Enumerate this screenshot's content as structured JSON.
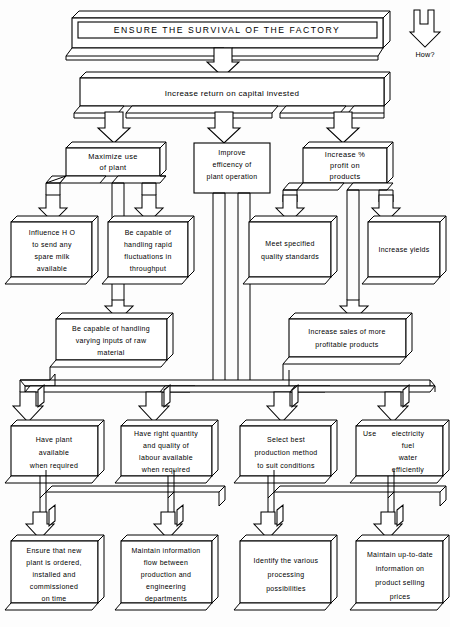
{
  "title": "ENSURE THE SURVIVAL OF THE FACTORY",
  "legend": {
    "label": "How?",
    "icon": "down-block-arrow-icon"
  },
  "level1": {
    "text": "Increase return on capital invested"
  },
  "level2": [
    {
      "id": "maximize-plant",
      "lines": [
        "Maximize use",
        "of plant"
      ]
    },
    {
      "id": "improve-efficiency",
      "lines": [
        "Improve",
        "efficency of",
        "plant operation"
      ]
    },
    {
      "id": "increase-profit",
      "lines": [
        "Increase %",
        "profit on",
        "products"
      ]
    }
  ],
  "level3": [
    {
      "id": "influence-ho",
      "lines": [
        "Influence H O",
        "to send any",
        "spare milk",
        "available"
      ]
    },
    {
      "id": "handle-fluctuations",
      "lines": [
        "Be capable of",
        "handling rapid",
        "fluctuations in",
        "throughput"
      ]
    },
    {
      "id": "quality-standards",
      "lines": [
        "Meet specified",
        "quality standards"
      ]
    },
    {
      "id": "increase-yields",
      "lines": [
        "Increase yields"
      ]
    }
  ],
  "level4": [
    {
      "id": "varying-inputs",
      "lines": [
        "Be capable of handling",
        "varying inputs of raw",
        "material"
      ]
    },
    {
      "id": "increase-sales",
      "lines": [
        "Increase sales of more",
        "profitable products"
      ]
    }
  ],
  "level5": [
    {
      "id": "plant-available",
      "lines": [
        "Have plant",
        "available",
        "when required"
      ]
    },
    {
      "id": "labour-available",
      "lines": [
        "Have right quantity",
        "and quality of",
        "labour available",
        "when required"
      ]
    },
    {
      "id": "best-production-method",
      "lines": [
        "Select best",
        "production method",
        "to suit conditions"
      ]
    },
    {
      "id": "use-utilities",
      "lines": [
        "Use      electricity",
        "fuel",
        "water",
        "efficiently"
      ],
      "first_line_left": "Use",
      "rest": [
        "electricity",
        "fuel",
        "water",
        "efficiently"
      ]
    }
  ],
  "level6": [
    {
      "id": "new-plant-ordered",
      "lines": [
        "Ensure that new",
        "plant is ordered,",
        "installed and",
        "commissioned",
        "on time"
      ]
    },
    {
      "id": "information-flow",
      "lines": [
        "Maintain information",
        "flow between",
        "production and",
        "engineering",
        "departments"
      ]
    },
    {
      "id": "processing-possibilities",
      "lines": [
        "Identify the various",
        "processing",
        "possibilities"
      ]
    },
    {
      "id": "selling-prices",
      "lines": [
        "Maintain up-to-date",
        "information on",
        "product selling",
        "prices"
      ]
    }
  ],
  "colors": {
    "line": "#000000",
    "fill": "#ffffff",
    "background": "#ffffff"
  }
}
